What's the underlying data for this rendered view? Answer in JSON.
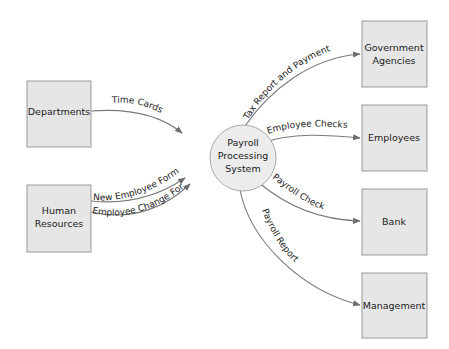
{
  "diagram": {
    "type": "data-flow-diagram",
    "process": {
      "line1": "Payroll",
      "line2": "Processing",
      "line3": "System"
    },
    "entities": {
      "departments": {
        "label": "Departments"
      },
      "human_resources": {
        "line1": "Human",
        "line2": "Resources"
      },
      "government_agencies": {
        "line1": "Government",
        "line2": "Agencies"
      },
      "employees": {
        "label": "Employees"
      },
      "bank": {
        "label": "Bank"
      },
      "management": {
        "label": "Management"
      }
    },
    "flows": {
      "time_cards": "Time Cards",
      "new_employee_form": "New Employee Form",
      "employee_change_form": "Employee Change Form",
      "tax_report": "Tax Report and Payment",
      "employee_checks": "Employee Checks",
      "payroll_check": "Payroll Check",
      "payroll_report": "Payroll Report"
    },
    "colors": {
      "box_fill": "#e6e6e6",
      "box_stroke": "#9a9a9a",
      "arrow": "#7a7a7a"
    }
  }
}
